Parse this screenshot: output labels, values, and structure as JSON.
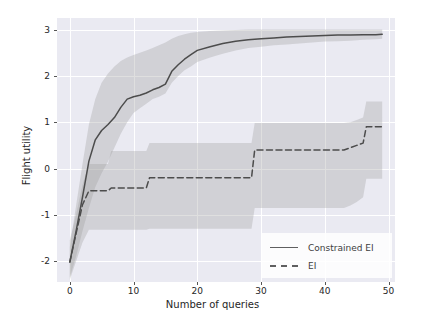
{
  "chart_data": {
    "type": "line",
    "title": "",
    "xlabel": "Number of queries",
    "ylabel": "Flight utility",
    "xlim": [
      -2,
      51
    ],
    "ylim": [
      -2.45,
      3.25
    ],
    "xticks": [
      0,
      10,
      20,
      30,
      40,
      50
    ],
    "yticks": [
      3,
      2,
      1,
      0,
      -1,
      -2
    ],
    "xtick_labels": [
      "0",
      "10",
      "20",
      "30",
      "40",
      "50"
    ],
    "ytick_labels": [
      "3",
      "2",
      "1",
      "0",
      "-1",
      "-2"
    ],
    "grid": true,
    "legend_position": "lower right",
    "background": "#eaeaf2",
    "line_color": "#4c4c4c",
    "band_color": "#9a9a9a",
    "series": [
      {
        "name": "Constrained EI",
        "style": "solid",
        "x": [
          0,
          1,
          2,
          3,
          4,
          5,
          6,
          7,
          8,
          9,
          10,
          11,
          12,
          13,
          14,
          15,
          16,
          17,
          18,
          19,
          20,
          22,
          24,
          26,
          28,
          30,
          32,
          34,
          36,
          38,
          40,
          42,
          44,
          46,
          48,
          49
        ],
        "values": [
          -2.02,
          -1.35,
          -0.62,
          0.16,
          0.62,
          0.82,
          0.95,
          1.1,
          1.32,
          1.5,
          1.55,
          1.58,
          1.63,
          1.7,
          1.75,
          1.82,
          2.1,
          2.24,
          2.36,
          2.46,
          2.55,
          2.63,
          2.7,
          2.75,
          2.78,
          2.8,
          2.82,
          2.84,
          2.85,
          2.86,
          2.87,
          2.88,
          2.88,
          2.89,
          2.89,
          2.9
        ],
        "band_lower": [
          -2.35,
          -1.9,
          -1.35,
          -0.85,
          -0.4,
          -0.1,
          0.15,
          0.45,
          0.75,
          1.0,
          1.2,
          1.3,
          1.4,
          1.5,
          1.55,
          1.62,
          1.85,
          2.0,
          2.12,
          2.2,
          2.3,
          2.4,
          2.48,
          2.55,
          2.6,
          2.63,
          2.66,
          2.68,
          2.7,
          2.72,
          2.74,
          2.75,
          2.76,
          2.78,
          2.79,
          2.8
        ],
        "band_upper": [
          -1.7,
          -0.8,
          0.1,
          0.95,
          1.5,
          1.85,
          2.05,
          2.2,
          2.32,
          2.4,
          2.45,
          2.5,
          2.55,
          2.6,
          2.66,
          2.72,
          2.8,
          2.86,
          2.9,
          2.93,
          2.95,
          2.97,
          2.98,
          2.99,
          3.0,
          3.0,
          3.0,
          3.0,
          3.0,
          3.0,
          3.0,
          3.0,
          3.0,
          3.0,
          3.0,
          3.0
        ]
      },
      {
        "name": "EI",
        "style": "dashed",
        "x": [
          0,
          1,
          2,
          3,
          6,
          6.5,
          12,
          12.5,
          13,
          28.5,
          29,
          43,
          44,
          45,
          46,
          46.5,
          49
        ],
        "values": [
          -2.02,
          -1.4,
          -0.78,
          -0.48,
          -0.48,
          -0.42,
          -0.42,
          -0.2,
          -0.2,
          -0.2,
          0.4,
          0.4,
          0.45,
          0.5,
          0.55,
          0.9,
          0.9
        ],
        "band_lower": [
          -2.4,
          -2.0,
          -1.6,
          -1.32,
          -1.32,
          -1.32,
          -1.32,
          -1.3,
          -1.3,
          -1.3,
          -0.85,
          -0.85,
          -0.8,
          -0.72,
          -0.62,
          -0.22,
          -0.22
        ],
        "band_upper": [
          -1.55,
          -1.0,
          -0.35,
          0.1,
          0.1,
          0.38,
          0.38,
          0.55,
          0.55,
          0.55,
          0.98,
          0.98,
          1.0,
          1.05,
          1.1,
          1.45,
          1.45
        ]
      }
    ]
  },
  "legend": {
    "items": [
      {
        "label": "Constrained EI",
        "style": "solid"
      },
      {
        "label": "EI",
        "style": "dashed"
      }
    ]
  }
}
